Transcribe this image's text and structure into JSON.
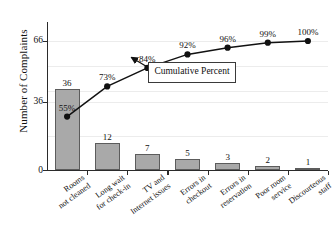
{
  "chart_data": {
    "type": "bar",
    "title": "",
    "subtitle": "",
    "xlabel": "",
    "ylabel": "Number of Complaints",
    "ylim": [
      0,
      66
    ],
    "y_ticks": [
      0,
      36,
      66
    ],
    "y_tick_labels": [
      "0",
      "36",
      "66"
    ],
    "grid": true,
    "legend": "none",
    "categories": [
      "Rooms not cleaned",
      "Long wait for check-in",
      "TV and Internet issues",
      "Errors in checkout",
      "Errors in reservation",
      "Poor room service",
      "Discourteous staff"
    ],
    "category_lines": [
      [
        "Rooms",
        "not cleaned"
      ],
      [
        "Long wait",
        "for check-in"
      ],
      [
        "TV and",
        "Internet issues"
      ],
      [
        "Errors in",
        "checkout"
      ],
      [
        "Errors in",
        "reservation"
      ],
      [
        "Poor room",
        "service"
      ],
      [
        "Discourteous",
        "staff"
      ]
    ],
    "values": [
      36,
      12,
      7,
      5,
      3,
      2,
      1
    ],
    "value_labels": [
      "36",
      "12",
      "7",
      "5",
      "3",
      "2",
      "1"
    ],
    "series": [
      {
        "name": "Number of Complaints",
        "type": "bar",
        "values": [
          36,
          12,
          7,
          5,
          3,
          2,
          1
        ]
      },
      {
        "name": "Cumulative Percent",
        "type": "line",
        "values": [
          55,
          73,
          84,
          92,
          96,
          99,
          100
        ],
        "labels": [
          "55%",
          "73%",
          "84%",
          "92%",
          "96%",
          "99%",
          "100%"
        ]
      }
    ],
    "annotations": [
      {
        "name": "cumulative-percent-callout",
        "lines": [
          "Cumulative",
          "Percent"
        ],
        "points_to_category": "TV and Internet issues"
      }
    ],
    "colors": {
      "bar_fill": "#a9a9a9",
      "bar_edge": "#5c5c5c",
      "line": "#111111",
      "marker": "#111111",
      "axis": "#2b2b2b",
      "grid": "#ececec",
      "text": "#111111",
      "background": "#ffffff"
    }
  }
}
